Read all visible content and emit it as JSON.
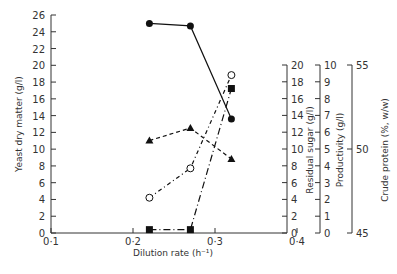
{
  "chart_data": {
    "type": "line",
    "title": "",
    "xlabel": "Dilution rate (h⁻¹)",
    "xlim": [
      0.1,
      0.4
    ],
    "xticks": [
      "0·1",
      "0·2",
      "0·3",
      "0·4"
    ],
    "x": [
      0.22,
      0.27,
      0.32
    ],
    "axes": [
      {
        "id": "dry",
        "label": "Yeast dry matter (g/l)",
        "position": "left",
        "ylim": [
          0,
          26
        ],
        "ticks": [
          0,
          2,
          4,
          6,
          8,
          10,
          12,
          14,
          16,
          18,
          20,
          22,
          24,
          26
        ]
      },
      {
        "id": "sugar",
        "label": "Residual sugar (g/l)",
        "position": "right-1",
        "ylim": [
          0,
          20
        ],
        "ticks": [
          0,
          2,
          4,
          6,
          8,
          10,
          12,
          14,
          16,
          18,
          20
        ]
      },
      {
        "id": "prod",
        "label": "Productivity (g/l)",
        "position": "right-2",
        "ylim": [
          0,
          10
        ],
        "ticks": [
          0,
          1,
          2,
          3,
          4,
          5,
          6,
          7,
          8,
          9,
          10
        ]
      },
      {
        "id": "protein",
        "label": "Crude protein (%, w/w)",
        "position": "right-3",
        "ylim": [
          45,
          55
        ],
        "ticks": [
          45,
          50,
          55
        ]
      }
    ],
    "series": [
      {
        "name": "Yeast dry matter",
        "axis": "dry",
        "marker": "filled-circle",
        "line": "solid",
        "values": [
          25.0,
          24.7,
          13.6
        ]
      },
      {
        "name": "Residual sugar",
        "axis": "sugar",
        "marker": "open-circle",
        "line": "dash-dot",
        "values": [
          4.2,
          7.7,
          18.8
        ]
      },
      {
        "name": "Productivity",
        "axis": "prod",
        "marker": "filled-square",
        "line": "long-dash-dot",
        "values": [
          0.2,
          0.2,
          8.6
        ]
      },
      {
        "name": "Crude protein",
        "axis": "protein",
        "marker": "filled-triangle",
        "line": "dashed",
        "values": [
          50.5,
          51.25,
          49.4
        ]
      }
    ],
    "grid": false,
    "legend": "none"
  },
  "colors": {
    "ink": "#111111",
    "axis": "#333333",
    "background": "#ffffff"
  }
}
